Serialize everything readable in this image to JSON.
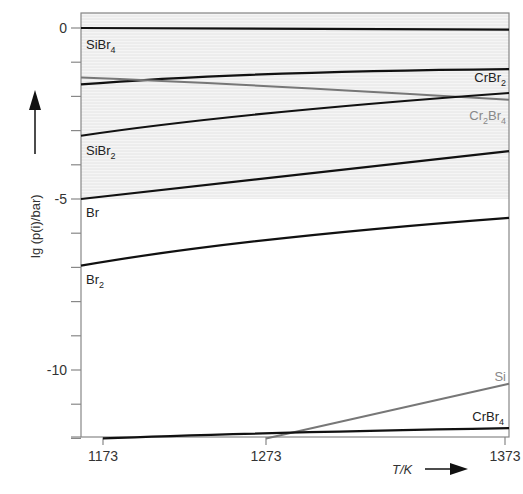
{
  "chart_data": {
    "type": "line",
    "title": "",
    "xlabel": "T/K",
    "ylabel": "lg (p(i)/bar)",
    "xlim": [
      1160,
      1375
    ],
    "ylim": [
      -12,
      0.45
    ],
    "x_ticks": [
      1173,
      1273,
      1373
    ],
    "x_tick_labels": [
      "1173",
      "1273",
      "1373"
    ],
    "y_ticks": [
      0,
      -1,
      -2,
      -3,
      -4,
      -5,
      -6,
      -7,
      -8,
      -9,
      -10,
      -11,
      -12
    ],
    "y_tick_labels": [
      {
        "value": 0,
        "label": "0"
      },
      {
        "value": -5,
        "label": "-5"
      },
      {
        "value": -10,
        "label": "-10"
      }
    ],
    "shaded_region": {
      "y_from": -5,
      "y_to": 0.45,
      "color": "#ececec"
    },
    "grid": false,
    "series": [
      {
        "name": "SiBr4",
        "label_main": "SiBr",
        "label_sub": "4",
        "color": "#111111",
        "x": [
          1160,
          1273,
          1375
        ],
        "y": [
          0.0,
          -0.02,
          -0.05
        ]
      },
      {
        "name": "CrBr2",
        "label_main": "CrBr",
        "label_sub": "2",
        "color": "#111111",
        "x": [
          1160,
          1273,
          1375
        ],
        "y": [
          -1.65,
          -1.35,
          -1.2
        ]
      },
      {
        "name": "Cr2Br4",
        "label_main": "Cr",
        "label_sub": "2",
        "label_main2": "Br",
        "label_sub2": "4",
        "color": "#777777",
        "x": [
          1160,
          1273,
          1375
        ],
        "y": [
          -1.45,
          -1.7,
          -2.1
        ]
      },
      {
        "name": "SiBr2",
        "label_main": "SiBr",
        "label_sub": "2",
        "color": "#111111",
        "x": [
          1160,
          1273,
          1375
        ],
        "y": [
          -3.15,
          -2.5,
          -1.9
        ]
      },
      {
        "name": "Br",
        "label_main": "Br",
        "label_sub": "",
        "color": "#111111",
        "x": [
          1160,
          1273,
          1375
        ],
        "y": [
          -5.0,
          -4.4,
          -3.6
        ]
      },
      {
        "name": "Br2",
        "label_main": "Br",
        "label_sub": "2",
        "color": "#111111",
        "x": [
          1160,
          1273,
          1375
        ],
        "y": [
          -6.95,
          -6.2,
          -5.55
        ]
      },
      {
        "name": "Si",
        "label_main": "Si",
        "label_sub": "",
        "color": "#777777",
        "x": [
          1273,
          1375
        ],
        "y": [
          -12.0,
          -10.4
        ]
      },
      {
        "name": "CrBr4",
        "label_main": "CrBr",
        "label_sub": "4",
        "color": "#111111",
        "x": [
          1173,
          1273,
          1375
        ],
        "y": [
          -12.0,
          -11.85,
          -11.7
        ]
      }
    ]
  }
}
